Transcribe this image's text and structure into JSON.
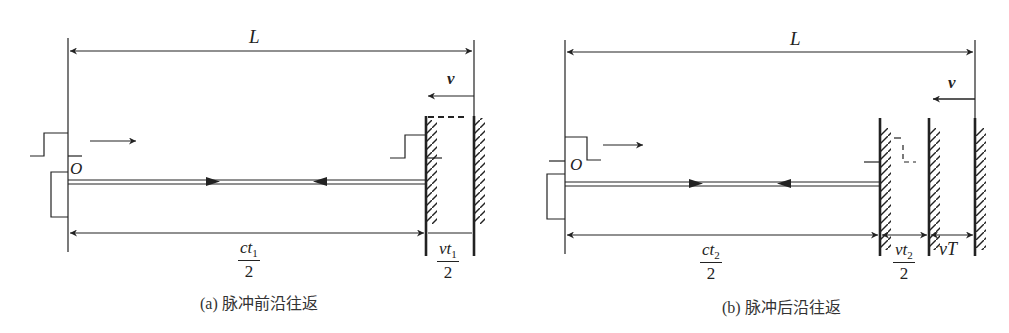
{
  "panels": [
    {
      "id": "a",
      "caption": "(a) 脉冲前沿往返",
      "length_label": "L",
      "velocity_label": "v",
      "origin_label": "O",
      "dims": [
        {
          "num_base": "ct",
          "num_sub": "1",
          "den": "2"
        },
        {
          "num_base": "vt",
          "num_sub": "1",
          "den": "2"
        }
      ]
    },
    {
      "id": "b",
      "caption": "(b) 脉冲后沿往返",
      "length_label": "L",
      "velocity_label": "v",
      "origin_label": "O",
      "dims": [
        {
          "num_base": "ct",
          "num_sub": "2",
          "den": "2"
        },
        {
          "num_base": "vt",
          "num_sub": "2",
          "den": "2"
        },
        {
          "label": "vT"
        }
      ]
    }
  ],
  "colors": {
    "stroke": "#222222",
    "background": "#ffffff"
  }
}
